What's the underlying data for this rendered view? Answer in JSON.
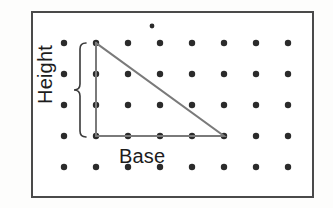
{
  "figure": {
    "kind": "geometry-diagram",
    "labels": {
      "height": "Height",
      "base": "Base"
    },
    "colors": {
      "page_background": "#fdfdfc",
      "panel_background": "#ffffff",
      "frame_border": "#4a4a4a",
      "dot": "#2b2b2b",
      "triangle_line": "#7a7a7a",
      "brace": "#3a3a3a",
      "text": "#1c1c1c"
    }
  },
  "chart_data": {
    "type": "scatter",
    "title": "",
    "xlabel": "Base",
    "ylabel": "Height",
    "grid": false,
    "legend": null,
    "xlim": [
      0,
      7
    ],
    "ylim": [
      0,
      4
    ],
    "dot_grid": {
      "columns": 8,
      "rows": 5,
      "x_start_px": 64,
      "y_start_px": 43,
      "x_step_px": 32,
      "y_step_px": 31,
      "dot_radius_px": 3.2,
      "description": "regular 8 by 5 array of dots"
    },
    "extra_points": [
      {
        "name": "stray-dot",
        "x_px": 152,
        "y_px": 26,
        "radius_px": 2.4,
        "note": "small isolated dot above the top grid row"
      }
    ],
    "shape": {
      "name": "right-triangle",
      "vertices_grid": [
        {
          "label": "apex",
          "col": 1,
          "row": 0
        },
        {
          "label": "right-angle",
          "col": 1,
          "row": 3
        },
        {
          "label": "base-end",
          "col": 5,
          "row": 3
        }
      ],
      "vertices_px": [
        {
          "x": 96,
          "y": 43
        },
        {
          "x": 96,
          "y": 136
        },
        {
          "x": 224,
          "y": 136
        }
      ],
      "base_units": 4,
      "height_units": 3,
      "stroke_width_px": 2
    },
    "annotations": [
      {
        "name": "height-brace",
        "text": "Height",
        "orientation": "vertical",
        "spans_grid_rows": [
          0,
          3
        ],
        "x_px": 80,
        "y_top_px": 43,
        "y_bottom_px": 137
      },
      {
        "name": "base-label",
        "text": "Base",
        "orientation": "horizontal",
        "spans_grid_cols": [
          1,
          5
        ],
        "x_px": 160,
        "y_px": 155
      }
    ]
  }
}
